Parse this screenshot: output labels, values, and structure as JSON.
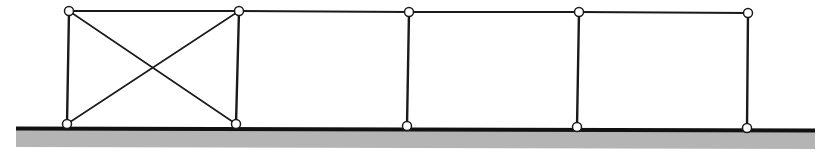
{
  "diagram": {
    "type": "braced-frame",
    "colors": {
      "stroke": "#1a1a1a",
      "ground_fill": "#b4b4b4",
      "ground_line": "#111111",
      "node_fill": "#ffffff"
    },
    "ground": {
      "x1": 16,
      "y1": 128,
      "x2": 815,
      "y2": 130,
      "depth": 19
    },
    "nodes": [
      {
        "id": "T1",
        "x": 69,
        "y": 11
      },
      {
        "id": "T2",
        "x": 239,
        "y": 11
      },
      {
        "id": "T3",
        "x": 409,
        "y": 12
      },
      {
        "id": "T4",
        "x": 579,
        "y": 12
      },
      {
        "id": "T5",
        "x": 748,
        "y": 13
      },
      {
        "id": "B1",
        "x": 67,
        "y": 124
      },
      {
        "id": "B2",
        "x": 236,
        "y": 124
      },
      {
        "id": "B3",
        "x": 407,
        "y": 126
      },
      {
        "id": "B4",
        "x": 577,
        "y": 127
      },
      {
        "id": "B5",
        "x": 747,
        "y": 128
      }
    ],
    "members": [
      {
        "from": "T1",
        "to": "T2",
        "kind": "top-chord"
      },
      {
        "from": "T2",
        "to": "T3",
        "kind": "top-chord"
      },
      {
        "from": "T3",
        "to": "T4",
        "kind": "top-chord"
      },
      {
        "from": "T4",
        "to": "T5",
        "kind": "top-chord"
      },
      {
        "from": "T1",
        "to": "B1",
        "kind": "column"
      },
      {
        "from": "T2",
        "to": "B2",
        "kind": "column"
      },
      {
        "from": "T3",
        "to": "B3",
        "kind": "column"
      },
      {
        "from": "T4",
        "to": "B4",
        "kind": "column"
      },
      {
        "from": "T5",
        "to": "B5",
        "kind": "column"
      },
      {
        "from": "T1",
        "to": "B2",
        "kind": "brace"
      },
      {
        "from": "T2",
        "to": "B1",
        "kind": "brace"
      }
    ]
  }
}
